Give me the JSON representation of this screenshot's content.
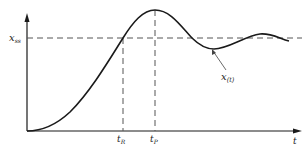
{
  "diagram": {
    "type": "step-response",
    "y_label": "x",
    "y_label_sub": "ss",
    "x_axis_label": "t",
    "curve_label": "x",
    "curve_label_sub": "(t)",
    "ticks": [
      {
        "label": "t",
        "sub": "R",
        "meaning": "rise time"
      },
      {
        "label": "t",
        "sub": "P",
        "meaning": "peak time"
      }
    ],
    "colors": {
      "line": "#1a1a1a",
      "dashed": "#555555",
      "background": "#ffffff"
    }
  }
}
